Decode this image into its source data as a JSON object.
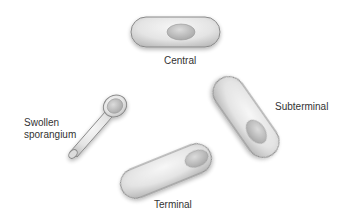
{
  "diagram": {
    "colors": {
      "background": "#ffffff",
      "cell_fill": "#e6e6e6",
      "cell_stroke": "#8a8a8a",
      "spore_fill": "#c4c4c4",
      "label_text": "#333333"
    },
    "cells": [
      {
        "id": "central",
        "label": "Central"
      },
      {
        "id": "swollen",
        "label_line1": "Swollen",
        "label_line2": "sporangium"
      },
      {
        "id": "subterminal",
        "label": "Subterminal"
      },
      {
        "id": "terminal",
        "label": "Terminal"
      }
    ]
  }
}
